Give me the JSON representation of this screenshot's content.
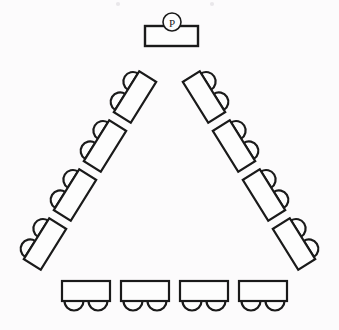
{
  "diagram": {
    "canvas": {
      "width": 339,
      "height": 330,
      "background": "#fcfbfc"
    },
    "stroke_color": "#1a1a1a",
    "fill_color": "#fdfdfd",
    "presenter": {
      "marker_label": "P",
      "marker_name": "presenter-position-marker",
      "desk_label": "Presenter table",
      "desk": {
        "x": 145,
        "y": 26,
        "width": 53,
        "height": 20
      },
      "marker": {
        "cx": 172,
        "cy": 22,
        "r": 9
      }
    },
    "counts": {
      "left_arm_desks": 4,
      "right_arm_desks": 4,
      "bottom_row_desks": 4,
      "seats_per_desk": 2,
      "total_desks": 12,
      "total_seats": 24,
      "presenter_tables": 1
    },
    "desk_size": {
      "length": 48,
      "depth": 20
    },
    "seat": {
      "radius": 9.5
    },
    "left_arm": {
      "label": "Left arm",
      "rotation_deg": -58,
      "seat_side": "outer-left",
      "desks": [
        {
          "id": "left-desk-1",
          "cx": 135,
          "cy": 97,
          "angle": -58
        },
        {
          "id": "left-desk-2",
          "cx": 105,
          "cy": 146,
          "angle": -58
        },
        {
          "id": "left-desk-3",
          "cx": 75,
          "cy": 195,
          "angle": -58
        },
        {
          "id": "left-desk-4",
          "cx": 45,
          "cy": 244,
          "angle": -58
        }
      ]
    },
    "right_arm": {
      "label": "Right arm",
      "rotation_deg": 58,
      "seat_side": "outer-right",
      "desks": [
        {
          "id": "right-desk-1",
          "cx": 204,
          "cy": 97,
          "angle": 58
        },
        {
          "id": "right-desk-2",
          "cx": 234,
          "cy": 146,
          "angle": 58
        },
        {
          "id": "right-desk-3",
          "cx": 264,
          "cy": 195,
          "angle": 58
        },
        {
          "id": "right-desk-4",
          "cx": 294,
          "cy": 244,
          "angle": 58
        }
      ]
    },
    "bottom_row": {
      "label": "Bottom row",
      "rotation_deg": 0,
      "seat_side": "below",
      "desks": [
        {
          "id": "bottom-desk-1",
          "cx": 86,
          "cy": 291,
          "angle": 0
        },
        {
          "id": "bottom-desk-2",
          "cx": 145,
          "cy": 291,
          "angle": 0
        },
        {
          "id": "bottom-desk-3",
          "cx": 204,
          "cy": 291,
          "angle": 0
        },
        {
          "id": "bottom-desk-4",
          "cx": 263,
          "cy": 291,
          "angle": 0
        }
      ]
    },
    "scan_specks": [
      {
        "cx": 118,
        "cy": 4,
        "r": 2.1
      },
      {
        "cx": 212,
        "cy": 4,
        "r": 2.1
      }
    ]
  }
}
